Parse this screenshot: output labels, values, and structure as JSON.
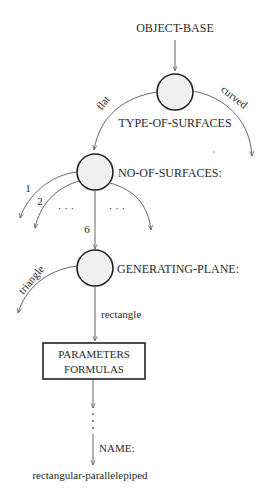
{
  "diagram": {
    "root_label": "OBJECT-BASE",
    "nodes": [
      {
        "id": "type",
        "label": "TYPE-OF-SURFACES"
      },
      {
        "id": "number",
        "label": "NO-OF-SURFACES:"
      },
      {
        "id": "plane",
        "label": "GENERATING-PLANE:"
      }
    ],
    "edges": {
      "flat": "flat",
      "curved": "curved",
      "one": "1",
      "two": "2",
      "ellipsis_left": "· · ·",
      "ellipsis_right": "· · ·",
      "six": "6",
      "triangle": "triangle",
      "rectangle": "rectangle",
      "name": "NAME:"
    },
    "box": {
      "line1": "PARAMETERS",
      "line2": "FORMULAS"
    },
    "result_label": "rectangular-parallelepiped",
    "vertical_ellipsis": "⋮",
    "colors": {
      "node_fill": "#efefef",
      "stroke": "#222222",
      "edge": "#555555"
    }
  }
}
